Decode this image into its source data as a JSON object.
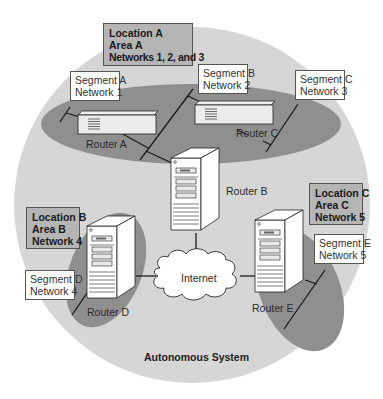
{
  "diagram": {
    "title": "Autonomous System",
    "colors": {
      "background": "#ffffff",
      "as_circle": "#d6d6d6",
      "area_shading": "#8f8f8f",
      "location_box": "#b5b5b5",
      "segment_box": "#ffffff",
      "line": "#1a1a1a"
    },
    "locations": [
      {
        "id": "A",
        "lines": [
          "Location A",
          "Area A",
          "Networks 1, 2, and 3"
        ]
      },
      {
        "id": "B",
        "lines": [
          "Location B",
          "Area B",
          "Network 4"
        ]
      },
      {
        "id": "C",
        "lines": [
          "Location C",
          "Area C",
          "Network 5"
        ]
      }
    ],
    "segments": [
      {
        "id": "A",
        "lines": [
          "Segment A",
          "Network 1"
        ]
      },
      {
        "id": "B",
        "lines": [
          "Segment B",
          "Network 2"
        ]
      },
      {
        "id": "C",
        "lines": [
          "Segment C",
          "Network 3"
        ]
      },
      {
        "id": "D",
        "lines": [
          "Segment D",
          "Network 4"
        ]
      },
      {
        "id": "E",
        "lines": [
          "Segment E",
          "Network 5"
        ]
      }
    ],
    "routers": [
      {
        "id": "A",
        "label": "Router A",
        "icon": "router-box-icon"
      },
      {
        "id": "B",
        "label": "Router B",
        "icon": "server-tower-icon"
      },
      {
        "id": "C",
        "label": "Router C",
        "icon": "router-box-icon"
      },
      {
        "id": "D",
        "label": "Router D",
        "icon": "server-tower-icon"
      },
      {
        "id": "E",
        "label": "Router E",
        "icon": "server-tower-icon"
      }
    ],
    "cloud": {
      "label": "Internet",
      "icon": "cloud-icon"
    }
  }
}
